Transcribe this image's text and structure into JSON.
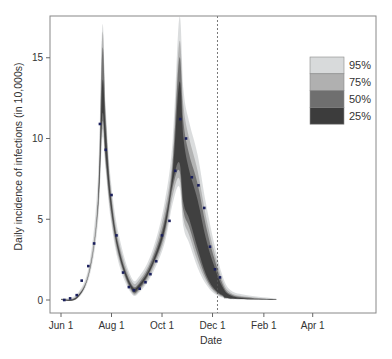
{
  "chart_data": {
    "type": "line",
    "title": "",
    "xlabel": "Date",
    "ylabel": "Daily incidence of infections (in 10,000s)",
    "ylim": [
      -0.8,
      17.5
    ],
    "yticks": [
      0,
      5,
      10,
      15
    ],
    "xticks": [
      {
        "label": "Jun 1",
        "day": 0
      },
      {
        "label": "Aug 1",
        "day": 61
      },
      {
        "label": "Oct 1",
        "day": 122
      },
      {
        "label": "Dec 1",
        "day": 183
      },
      {
        "label": "Feb 1",
        "day": 245
      },
      {
        "label": "Apr 1",
        "day": 304
      }
    ],
    "xlim_days": [
      -13,
      380
    ],
    "forecast_start_day": 189,
    "legend": {
      "position": "upper right",
      "entries": [
        {
          "label": "95%",
          "color": "#d8dadb"
        },
        {
          "label": "75%",
          "color": "#b0b0b0"
        },
        {
          "label": "50%",
          "color": "#6f6f6f"
        },
        {
          "label": "25%",
          "color": "#3c3c3c"
        }
      ]
    },
    "observed_points": {
      "name": "Observed weekly incidence",
      "color": "#1a1f5c",
      "days": [
        4,
        11,
        19,
        25,
        33,
        40,
        47,
        54,
        61,
        67,
        75,
        82,
        88,
        95,
        102,
        108,
        115,
        122,
        131,
        138,
        144,
        151,
        158,
        166,
        173,
        180,
        186,
        192
      ],
      "values": [
        0.0,
        0.1,
        0.3,
        1.2,
        2.1,
        3.5,
        10.9,
        9.3,
        6.5,
        4.0,
        1.7,
        0.8,
        0.6,
        0.7,
        1.1,
        1.6,
        2.4,
        4.0,
        4.9,
        8.0,
        11.2,
        10.0,
        7.6,
        7.1,
        5.7,
        3.3,
        1.9,
        1.4
      ]
    },
    "bands": [
      {
        "level": "95%",
        "color": "#d8dadb",
        "upper": [
          [
            0,
            0.1
          ],
          [
            20,
            0.4
          ],
          [
            35,
            2.5
          ],
          [
            45,
            8
          ],
          [
            50,
            17.0
          ],
          [
            54,
            12
          ],
          [
            60,
            7.5
          ],
          [
            70,
            4
          ],
          [
            85,
            1.4
          ],
          [
            95,
            1.5
          ],
          [
            110,
            3
          ],
          [
            125,
            6
          ],
          [
            135,
            10
          ],
          [
            143,
            17.5
          ],
          [
            148,
            13
          ],
          [
            155,
            11
          ],
          [
            165,
            9
          ],
          [
            175,
            6
          ],
          [
            185,
            3.5
          ],
          [
            195,
            1.5
          ],
          [
            205,
            0.6
          ],
          [
            225,
            0.3
          ],
          [
            260,
            0.1
          ]
        ],
        "lower": [
          [
            0,
            0.0
          ],
          [
            20,
            0.1
          ],
          [
            35,
            1.6
          ],
          [
            45,
            5
          ],
          [
            50,
            10
          ],
          [
            54,
            8
          ],
          [
            60,
            5
          ],
          [
            70,
            2.2
          ],
          [
            85,
            0.4
          ],
          [
            95,
            0.5
          ],
          [
            110,
            1.6
          ],
          [
            125,
            3.5
          ],
          [
            135,
            6
          ],
          [
            143,
            7
          ],
          [
            148,
            4.5
          ],
          [
            155,
            3.5
          ],
          [
            165,
            2
          ],
          [
            175,
            1
          ],
          [
            185,
            0.4
          ],
          [
            195,
            0.15
          ],
          [
            205,
            0.05
          ],
          [
            260,
            0.0
          ]
        ]
      },
      {
        "level": "75%",
        "color": "#b0b0b0",
        "upper": [
          [
            0,
            0.05
          ],
          [
            20,
            0.3
          ],
          [
            35,
            2.2
          ],
          [
            45,
            7
          ],
          [
            50,
            16.5
          ],
          [
            54,
            11.5
          ],
          [
            60,
            7
          ],
          [
            70,
            3.6
          ],
          [
            85,
            1.2
          ],
          [
            95,
            1.3
          ],
          [
            110,
            2.7
          ],
          [
            125,
            5.5
          ],
          [
            135,
            9
          ],
          [
            143,
            16
          ],
          [
            148,
            12
          ],
          [
            155,
            10
          ],
          [
            165,
            8
          ],
          [
            175,
            5.2
          ],
          [
            185,
            3
          ],
          [
            195,
            1.2
          ],
          [
            205,
            0.45
          ],
          [
            225,
            0.2
          ],
          [
            260,
            0.05
          ]
        ],
        "lower": [
          [
            0,
            0.0
          ],
          [
            20,
            0.12
          ],
          [
            35,
            1.8
          ],
          [
            45,
            5.5
          ],
          [
            50,
            10.5
          ],
          [
            54,
            8.3
          ],
          [
            60,
            5.3
          ],
          [
            70,
            2.5
          ],
          [
            85,
            0.5
          ],
          [
            95,
            0.6
          ],
          [
            110,
            1.8
          ],
          [
            125,
            3.8
          ],
          [
            135,
            6.5
          ],
          [
            143,
            7.5
          ],
          [
            148,
            5
          ],
          [
            155,
            4
          ],
          [
            165,
            2.4
          ],
          [
            175,
            1.2
          ],
          [
            185,
            0.5
          ],
          [
            195,
            0.2
          ],
          [
            205,
            0.07
          ],
          [
            260,
            0.0
          ]
        ]
      },
      {
        "level": "50%",
        "color": "#6f6f6f",
        "upper": [
          [
            0,
            0.03
          ],
          [
            20,
            0.25
          ],
          [
            35,
            2.0
          ],
          [
            45,
            6.5
          ],
          [
            50,
            15.5
          ],
          [
            54,
            11.2
          ],
          [
            60,
            6.7
          ],
          [
            70,
            3.3
          ],
          [
            85,
            1.0
          ],
          [
            95,
            1.1
          ],
          [
            110,
            2.5
          ],
          [
            125,
            5
          ],
          [
            135,
            8.5
          ],
          [
            143,
            15
          ],
          [
            148,
            11
          ],
          [
            155,
            9
          ],
          [
            165,
            7.2
          ],
          [
            175,
            4.6
          ],
          [
            185,
            2.6
          ],
          [
            195,
            1.0
          ],
          [
            205,
            0.35
          ],
          [
            225,
            0.15
          ],
          [
            260,
            0.03
          ]
        ],
        "lower": [
          [
            0,
            0.0
          ],
          [
            20,
            0.14
          ],
          [
            35,
            1.9
          ],
          [
            45,
            5.8
          ],
          [
            50,
            11
          ],
          [
            54,
            8.6
          ],
          [
            60,
            5.6
          ],
          [
            70,
            2.7
          ],
          [
            85,
            0.6
          ],
          [
            95,
            0.7
          ],
          [
            110,
            2.0
          ],
          [
            125,
            4.1
          ],
          [
            135,
            7
          ],
          [
            143,
            8
          ],
          [
            148,
            5.5
          ],
          [
            155,
            4.5
          ],
          [
            165,
            2.8
          ],
          [
            175,
            1.4
          ],
          [
            185,
            0.6
          ],
          [
            195,
            0.25
          ],
          [
            205,
            0.09
          ],
          [
            260,
            0.0
          ]
        ]
      },
      {
        "level": "25%",
        "color": "#3c3c3c",
        "upper": [
          [
            0,
            0.02
          ],
          [
            20,
            0.22
          ],
          [
            35,
            1.95
          ],
          [
            45,
            6.2
          ],
          [
            50,
            13.5
          ],
          [
            54,
            10.5
          ],
          [
            60,
            6.4
          ],
          [
            70,
            3.1
          ],
          [
            85,
            0.9
          ],
          [
            95,
            1.0
          ],
          [
            110,
            2.3
          ],
          [
            125,
            4.7
          ],
          [
            135,
            8
          ],
          [
            143,
            13.5
          ],
          [
            148,
            10
          ],
          [
            155,
            8
          ],
          [
            165,
            6.2
          ],
          [
            175,
            3.8
          ],
          [
            185,
            2.1
          ],
          [
            195,
            0.8
          ],
          [
            205,
            0.28
          ],
          [
            225,
            0.1
          ],
          [
            260,
            0.02
          ]
        ],
        "lower": [
          [
            0,
            0.0
          ],
          [
            20,
            0.16
          ],
          [
            35,
            1.92
          ],
          [
            45,
            6.0
          ],
          [
            50,
            11.5
          ],
          [
            54,
            9.0
          ],
          [
            60,
            5.9
          ],
          [
            70,
            2.85
          ],
          [
            85,
            0.7
          ],
          [
            95,
            0.8
          ],
          [
            110,
            2.1
          ],
          [
            125,
            4.3
          ],
          [
            135,
            7.3
          ],
          [
            143,
            8.5
          ],
          [
            148,
            6.0
          ],
          [
            155,
            5.0
          ],
          [
            165,
            3.2
          ],
          [
            175,
            1.6
          ],
          [
            185,
            0.7
          ],
          [
            195,
            0.3
          ],
          [
            205,
            0.1
          ],
          [
            260,
            0.0
          ]
        ]
      }
    ]
  }
}
